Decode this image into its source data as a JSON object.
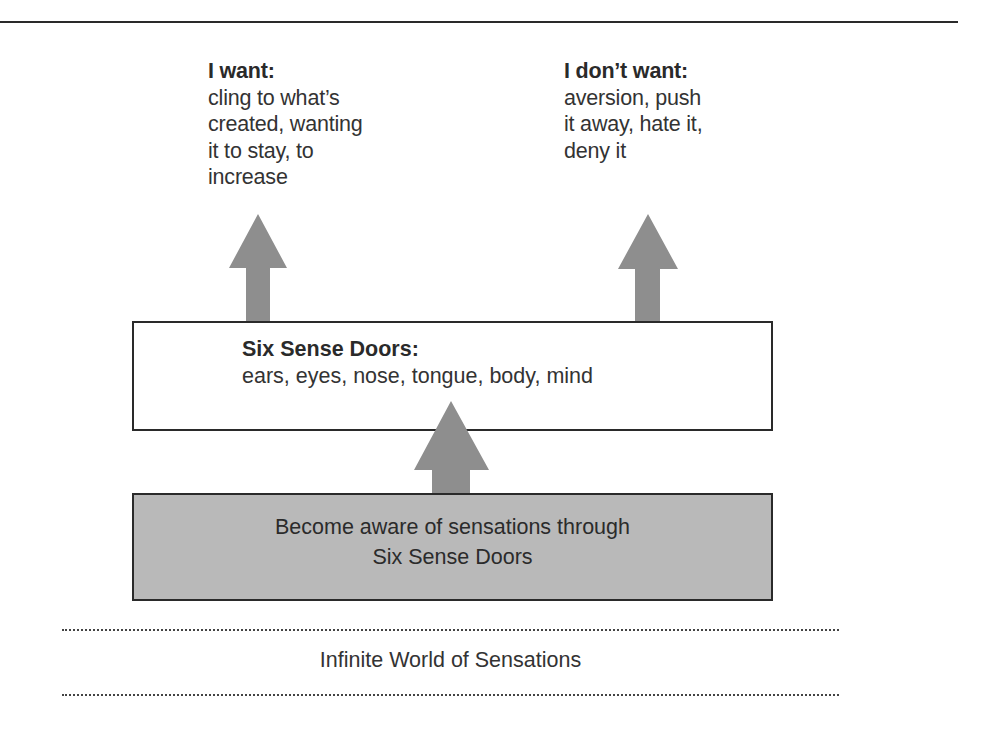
{
  "diagram": {
    "want": {
      "heading": "I want:",
      "lines": [
        "cling to what’s",
        "created, wanting",
        "it to stay, to",
        "increase"
      ]
    },
    "dont_want": {
      "heading": "I don’t want:",
      "lines": [
        "aversion, push",
        "it away, hate it,",
        "deny it"
      ]
    },
    "sense_doors": {
      "heading": "Six Sense Doors:",
      "text": "ears, eyes, nose, tongue, body, mind"
    },
    "awareness": {
      "lines": [
        "Become aware of sensations through",
        "Six Sense Doors"
      ]
    },
    "world": {
      "label": "Infinite World of Sensations"
    },
    "arrows": [
      {
        "name": "arrow-to-want",
        "from": "Six Sense Doors",
        "to": "I want"
      },
      {
        "name": "arrow-to-dont-want",
        "from": "Six Sense Doors",
        "to": "I don't want"
      },
      {
        "name": "arrow-to-sense-doors",
        "from": "Become aware of sensations",
        "to": "Six Sense Doors"
      }
    ],
    "colors": {
      "arrow": "#8e8e8e",
      "awareness_fill": "#b9b9b9",
      "border": "#2a2a2a",
      "text": "#333333"
    }
  }
}
